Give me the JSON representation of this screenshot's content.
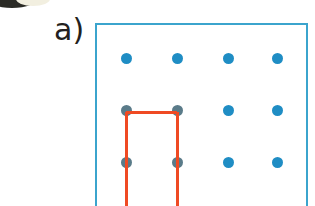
{
  "figure": {
    "panel_label": "a)",
    "type": "peg-board-lattice-diagram",
    "caption_visible": false
  },
  "colors": {
    "peg_blue": "#1f8dc4",
    "peg_covered": "#5a7b89",
    "frame_blue": "#3ba4cd",
    "loop_red": "#ef4a23",
    "label_text": "#231f20",
    "background": "#ffffff"
  },
  "board": {
    "frame": {
      "x": 95,
      "y": 23,
      "width": 213,
      "height": 200,
      "stroke_width": 2,
      "cropped_bottom": true
    },
    "columns": 4,
    "rows": 3,
    "column_x": [
      126,
      177,
      228,
      277
    ],
    "row_y": [
      58,
      110,
      162
    ],
    "peg_radius": 5.5
  },
  "pegs": [
    {
      "row": 0,
      "col": 0,
      "x": 126,
      "y": 58,
      "covered": false
    },
    {
      "row": 0,
      "col": 1,
      "x": 177,
      "y": 58,
      "covered": false
    },
    {
      "row": 0,
      "col": 2,
      "x": 228,
      "y": 58,
      "covered": false
    },
    {
      "row": 0,
      "col": 3,
      "x": 277,
      "y": 58,
      "covered": false
    },
    {
      "row": 1,
      "col": 0,
      "x": 126,
      "y": 110,
      "covered": true
    },
    {
      "row": 1,
      "col": 1,
      "x": 177,
      "y": 110,
      "covered": true
    },
    {
      "row": 1,
      "col": 2,
      "x": 228,
      "y": 110,
      "covered": false
    },
    {
      "row": 1,
      "col": 3,
      "x": 277,
      "y": 110,
      "covered": false
    },
    {
      "row": 2,
      "col": 0,
      "x": 126,
      "y": 162,
      "covered": true
    },
    {
      "row": 2,
      "col": 1,
      "x": 177,
      "y": 162,
      "covered": true
    },
    {
      "row": 2,
      "col": 2,
      "x": 228,
      "y": 162,
      "covered": false
    },
    {
      "row": 2,
      "col": 3,
      "x": 277,
      "y": 162,
      "covered": false
    }
  ],
  "loop": {
    "stroke_width": 3,
    "cropped_bottom": true,
    "segments": [
      {
        "id": "top",
        "orientation": "h",
        "x1": 126,
        "x2": 177,
        "y": 112
      },
      {
        "id": "left",
        "orientation": "v",
        "x": 126,
        "y1": 112,
        "y2": 206
      },
      {
        "id": "right",
        "orientation": "v",
        "x": 177,
        "y1": 112,
        "y2": 206
      }
    ]
  }
}
